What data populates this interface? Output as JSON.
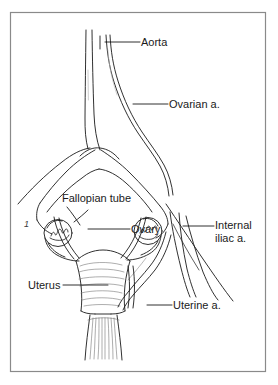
{
  "figure": {
    "background_color": "#ffffff",
    "frame_color": "#808080",
    "ink_color": "#1a1a1a",
    "frame": {
      "x": 10,
      "y": 12,
      "width": 256,
      "height": 360
    }
  },
  "labels": {
    "aorta": "Aorta",
    "ovarian_artery": "Ovarian a.",
    "fallopian_tube": "Fallopian tube",
    "ovary": "Ovary",
    "internal_iliac_line1": "Internal",
    "internal_iliac_line2": "iliac a.",
    "uterus": "Uterus",
    "uterine_artery": "Uterine a.",
    "marker_one": "1"
  },
  "structures": [
    {
      "name": "aorta",
      "kind": "artery"
    },
    {
      "name": "ovarian-artery",
      "kind": "artery"
    },
    {
      "name": "internal-iliac-artery",
      "kind": "artery"
    },
    {
      "name": "uterine-artery",
      "kind": "artery"
    },
    {
      "name": "uterus",
      "kind": "organ"
    },
    {
      "name": "left-ovary",
      "kind": "organ"
    },
    {
      "name": "right-ovary",
      "kind": "organ"
    },
    {
      "name": "fallopian-tube",
      "kind": "organ"
    },
    {
      "name": "broad-ligament",
      "kind": "ligament"
    },
    {
      "name": "vagina",
      "kind": "organ"
    }
  ]
}
